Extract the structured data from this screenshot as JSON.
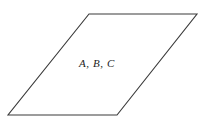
{
  "figure": {
    "name": "parallelogram-with-collinear-points-label",
    "background_color": "#ffffff",
    "canvas": {
      "width": 207,
      "height": 130
    },
    "shape": {
      "kind": "parallelogram",
      "stroke_color": "#3a3a3a",
      "fill_color": "#ffffff",
      "stroke_width": 1.1,
      "points": "89,14 197,14 117,115 8,115",
      "vertices": [
        {
          "name": "top-left",
          "x": 89,
          "y": 14
        },
        {
          "name": "top-right",
          "x": 197,
          "y": 14
        },
        {
          "name": "bottom-right",
          "x": 117,
          "y": 115
        },
        {
          "name": "bottom-left",
          "x": 8,
          "y": 115
        }
      ]
    },
    "label": {
      "text": "A, B, C",
      "x": 97,
      "y": 64,
      "font_size": "11px",
      "font_style": "italic",
      "color": "#1c1c1c"
    }
  }
}
